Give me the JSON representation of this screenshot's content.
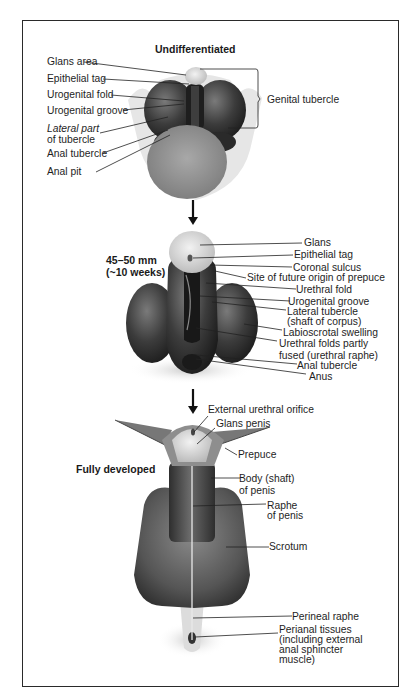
{
  "stages": {
    "undifferentiated": {
      "title": "Undifferentiated",
      "labels": {
        "glans_area": "Glans area",
        "epithelial_tag": "Epithelial tag",
        "urogenital_fold": "Urogenital fold",
        "urogenital_groove": "Urogenital groove",
        "lateral_part_1": "Lateral part",
        "lateral_part_2": "of tubercle",
        "anal_tubercle": "Anal tubercle",
        "anal_pit": "Anal pit",
        "genital_tubercle": "Genital tubercle"
      }
    },
    "intermediate": {
      "title_line1": "45–50 mm",
      "title_line2": "(~10 weeks)",
      "labels": {
        "glans": "Glans",
        "epithelial_tag": "Epithelial tag",
        "coronal_sulcus": "Coronal sulcus",
        "prepuce_site": "Site of future origin of prepuce",
        "urethral_fold": "Urethral fold",
        "urogenital_groove": "Urogenital groove",
        "lateral_tubercle_1": "Lateral tubercle",
        "lateral_tubercle_2": "(shaft of corpus)",
        "labioscrotal_swelling": "Labioscrotal swelling",
        "urethral_folds_1": "Urethral folds partly",
        "urethral_folds_2": "fused (urethral raphe)",
        "anal_tubercle": "Anal tubercle",
        "anus": "Anus"
      }
    },
    "developed": {
      "title": "Fully developed",
      "labels": {
        "external_urethral_orifice": "External urethral orifice",
        "glans_penis": "Glans penis",
        "prepuce": "Prepuce",
        "body_1": "Body (shaft)",
        "body_2": "of penis",
        "raphe_1": "Raphe",
        "raphe_2": "of penis",
        "scrotum": "Scrotum",
        "perineal_raphe": "Perineal raphe",
        "perianal_1": "Perianal tissues",
        "perianal_2": "(including external",
        "perianal_3": "anal sphincter",
        "perianal_4": "muscle)"
      }
    }
  },
  "colors": {
    "border": "#2a2a2a",
    "tissue_dark": "#3a3a3a",
    "tissue_mid": "#6e6e6e",
    "tissue_light": "#d9d9d9"
  }
}
